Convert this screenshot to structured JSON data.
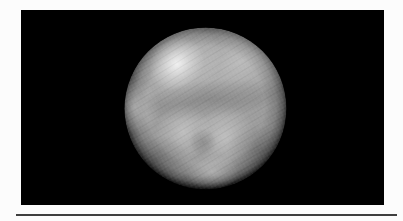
{
  "scene": {
    "type": "rendered-image",
    "description": "Grayscale 3-D rendering of a mottled planetary sphere (Pluto-like globe) centered on a solid black rectangular field, surrounded by a white page margin, with a thin dark horizontal rule running beneath the panel near the bottom edge.",
    "colors": {
      "page_background": "#fcfcfc",
      "panel_background": "#000000",
      "sphere_base": "#9a9a9a",
      "sphere_highlight": "#f7f7f7",
      "sphere_limb": "#060606",
      "separator_rule": "#3f3f3f"
    }
  }
}
